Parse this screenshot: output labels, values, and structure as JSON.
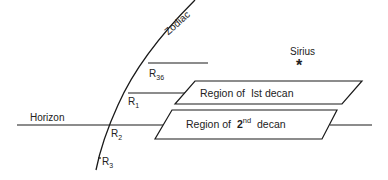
{
  "diagram": {
    "zodiac_label": "Zodiac",
    "horizon_label": "Horizon",
    "star_label": "Sirius",
    "star_icon": "asterisk-star-icon",
    "points": {
      "r36": "R",
      "r36_sub": "36",
      "r1": "R",
      "r1_sub": "1",
      "r2": "R",
      "r2_sub": "2",
      "r3": "R",
      "r3_sub": "3"
    },
    "regions": {
      "first": {
        "prefix": "Region of",
        "ordinal": "Ist decan"
      },
      "second": {
        "prefix": "Region of",
        "number": "2",
        "sup": "nd",
        "suffix": "decan"
      }
    },
    "colors": {
      "line": "#1a1a1a",
      "background": "#ffffff"
    }
  }
}
